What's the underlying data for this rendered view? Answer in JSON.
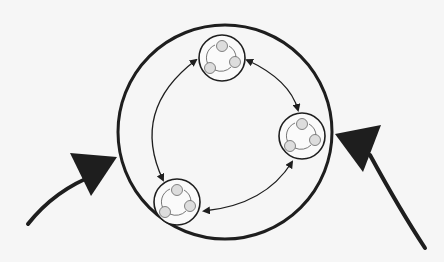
{
  "diagram": {
    "colors": {
      "background": "#f6f6f6",
      "stroke": "#1e1e1e",
      "node_fill": "#d9d9d9"
    },
    "outer_circle": {
      "cx": 225,
      "cy": 132,
      "r": 107
    },
    "subsystems": [
      {
        "id": "top",
        "cx": 222,
        "cy": 58,
        "r": 23
      },
      {
        "id": "right",
        "cx": 302,
        "cy": 136,
        "r": 23
      },
      {
        "id": "bottom-left",
        "cx": 177,
        "cy": 202,
        "r": 23
      }
    ],
    "inner_links": [
      {
        "from": "top",
        "to": "right",
        "type": "bidirectional"
      },
      {
        "from": "right",
        "to": "bottom-left",
        "type": "bidirectional"
      },
      {
        "from": "bottom-left",
        "to": "top",
        "type": "bidirectional"
      }
    ],
    "external_inputs": [
      {
        "id": "left-input",
        "direction": "into-system-from-lower-left"
      },
      {
        "id": "right-input",
        "direction": "into-system-from-lower-right"
      }
    ]
  }
}
